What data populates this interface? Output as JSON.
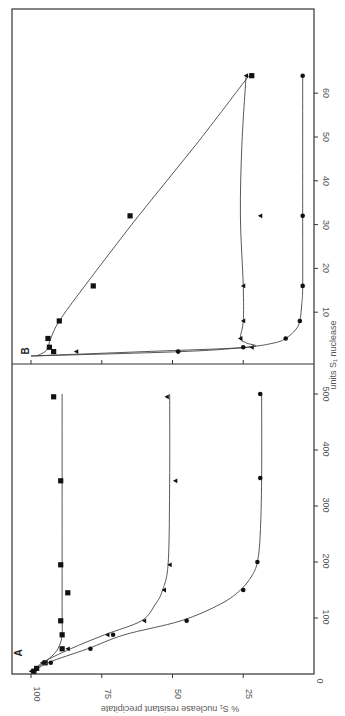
{
  "chart_data": [
    {
      "panel": "A",
      "type": "scatter",
      "title": "",
      "xlabel": "units S1 nuclease",
      "ylabel": "% S1 nuclease resistant precipitate",
      "xlim": [
        0,
        500
      ],
      "ylim": [
        0,
        100
      ],
      "x_ticks": [
        0,
        100,
        200,
        300,
        400,
        500
      ],
      "y_ticks": [
        0,
        25,
        50,
        75,
        100
      ],
      "grid": false,
      "legend": "none",
      "orientation_note": "figure rotated 90 degrees counter-clockwise",
      "series": [
        {
          "name": "square",
          "marker": "square",
          "x": [
            5,
            10,
            20,
            45,
            70,
            95,
            145,
            195,
            345,
            495
          ],
          "y": [
            99,
            98,
            95,
            89,
            89,
            89.5,
            87,
            89.5,
            89.5,
            92
          ],
          "curve_x": [
            0,
            10,
            20,
            35,
            50,
            70,
            100,
            200,
            350,
            500
          ],
          "curve_y": [
            100,
            98,
            95.5,
            92,
            90,
            89,
            89,
            89,
            89,
            89
          ]
        },
        {
          "name": "triangle",
          "marker": "triangle",
          "x": [
            5,
            20,
            45,
            70,
            95,
            150,
            195,
            345,
            495
          ],
          "y": [
            100,
            96,
            87,
            73,
            60,
            53,
            51,
            49,
            52
          ],
          "curve_x": [
            0,
            20,
            45,
            70,
            95,
            125,
            150,
            200,
            350,
            500
          ],
          "curve_y": [
            100,
            96,
            86,
            74,
            61,
            56,
            53.5,
            51.5,
            51,
            51
          ]
        },
        {
          "name": "circle",
          "marker": "circle",
          "x": [
            5,
            10,
            20,
            45,
            70,
            95,
            150,
            200,
            350,
            500
          ],
          "y": [
            99,
            98,
            93,
            79,
            71,
            45,
            25,
            20,
            19,
            19
          ],
          "curve_x": [
            0,
            20,
            45,
            70,
            95,
            125,
            150,
            175,
            200,
            250,
            350,
            500
          ],
          "curve_y": [
            100,
            94,
            80,
            67,
            47,
            33,
            26,
            22,
            20,
            19,
            18.5,
            18.5
          ]
        }
      ]
    },
    {
      "panel": "B",
      "type": "scatter",
      "title": "",
      "xlabel": "units S1 nuclease",
      "ylabel": "% S1 nuclease resistant precipitate",
      "xlim": [
        0,
        65
      ],
      "ylim": [
        0,
        100
      ],
      "x_ticks": [
        10,
        20,
        30,
        40,
        50,
        60
      ],
      "y_ticks": [
        0,
        25,
        50,
        75,
        100
      ],
      "grid": false,
      "legend": "none",
      "series": [
        {
          "name": "square",
          "marker": "square",
          "x": [
            1,
            2,
            4,
            8,
            16,
            32,
            64
          ],
          "y": [
            92,
            93.5,
            94,
            90,
            78,
            65,
            22
          ],
          "curve_x": [
            0,
            1,
            2,
            4,
            8,
            16,
            32,
            48,
            64
          ],
          "curve_y": [
            98,
            95,
            94,
            93,
            90,
            81,
            62,
            42,
            23
          ]
        },
        {
          "name": "triangle",
          "marker": "triangle",
          "x": [
            1,
            2,
            4,
            8,
            16,
            32,
            64
          ],
          "y": [
            84,
            22,
            26,
            25,
            25,
            19,
            24
          ],
          "curve_x": [
            0,
            1,
            2,
            3,
            4,
            8,
            16,
            32,
            48,
            64
          ],
          "curve_y": [
            100,
            60,
            23,
            24,
            26,
            25,
            25,
            26,
            25.5,
            24
          ]
        },
        {
          "name": "circle",
          "marker": "circle",
          "x": [
            1,
            2,
            4,
            8,
            16,
            32,
            64
          ],
          "y": [
            48,
            25,
            10,
            5,
            4,
            4,
            4
          ],
          "curve_x": [
            0,
            1,
            2,
            3,
            4,
            6,
            8,
            12,
            16,
            32,
            64
          ],
          "curve_y": [
            100,
            47,
            24,
            14,
            10,
            6.5,
            5,
            4.3,
            4,
            4,
            4
          ]
        }
      ]
    }
  ],
  "labels": {
    "panel_a": "A",
    "panel_b": "B",
    "y_axis_title": "% S₁ nuclease   resistant precipitate",
    "x_axis_title": "units S₁ nuclease",
    "y_ticks": [
      "100",
      "75",
      "50",
      "25",
      "0"
    ],
    "a_x_ticks": [
      "100",
      "200",
      "300",
      "400",
      "500"
    ],
    "b_x_ticks": [
      "10",
      "20",
      "30",
      "40",
      "50",
      "60"
    ]
  },
  "colors": {
    "ink": "#111111",
    "axis": "#333333",
    "text": "#555555",
    "background": "#ffffff"
  }
}
